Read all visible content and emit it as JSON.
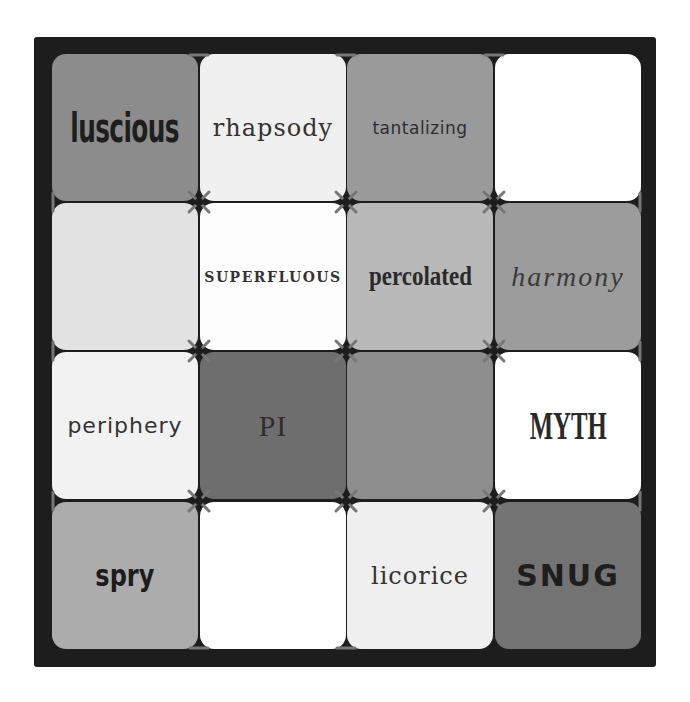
{
  "board": {
    "background": "#1d1d1d",
    "rows": 4,
    "cols": 4
  },
  "tiles": [
    {
      "word": "luscious",
      "color": "#8c8c8c",
      "style": "f-luscious"
    },
    {
      "word": "rhapsody",
      "color": "#f0f0f0",
      "style": "f-rhapsody"
    },
    {
      "word": "tantalizing",
      "color": "#9a9a9a",
      "style": "f-tantalizing"
    },
    {
      "word": "",
      "color": "#ffffff",
      "style": ""
    },
    {
      "word": "",
      "color": "#e2e2e2",
      "style": ""
    },
    {
      "word": "SUPERFLUOUS",
      "color": "#fdfdfd",
      "style": "f-superfluous"
    },
    {
      "word": "percolated",
      "color": "#b9b9b9",
      "style": "f-percolated"
    },
    {
      "word": "harmony",
      "color": "#9c9c9c",
      "style": "f-harmony"
    },
    {
      "word": "periphery",
      "color": "#f2f2f2",
      "style": "f-periphery"
    },
    {
      "word": "PI",
      "color": "#6e6e6e",
      "style": "f-pi"
    },
    {
      "word": "",
      "color": "#8e8e8e",
      "style": ""
    },
    {
      "word": "MYTH",
      "color": "#ffffff",
      "style": "f-myth"
    },
    {
      "word": "spry",
      "color": "#acacac",
      "style": "f-spry"
    },
    {
      "word": "",
      "color": "#ffffff",
      "style": ""
    },
    {
      "word": "licorice",
      "color": "#efefef",
      "style": "f-licorice"
    },
    {
      "word": "SNUG",
      "color": "#737373",
      "style": "f-snug"
    }
  ],
  "stitch_color": "#777777"
}
